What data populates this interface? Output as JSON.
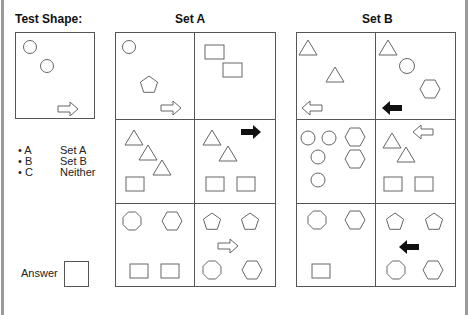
{
  "test_shape": {
    "title": "Test Shape:",
    "contents": [
      "circle",
      "circle",
      "arrow-right-outline"
    ]
  },
  "legend": [
    {
      "key": "• A",
      "label": "Set A"
    },
    {
      "key": "• B",
      "label": "Set B"
    },
    {
      "key": "• C",
      "label": "Neither"
    }
  ],
  "answer": {
    "label": "Answer",
    "value": ""
  },
  "set_a": {
    "title": "Set A",
    "cells": [
      [
        "circle",
        "pentagon",
        "arrow-right-outline"
      ],
      [
        "square",
        "square"
      ],
      [
        "triangle",
        "triangle",
        "triangle",
        "square"
      ],
      [
        "triangle",
        "triangle",
        "arrow-right-solid",
        "square",
        "square"
      ],
      [
        "octagon",
        "hexagon",
        "square",
        "square"
      ],
      [
        "pentagon",
        "pentagon",
        "arrow-right-outline",
        "octagon",
        "hexagon"
      ]
    ]
  },
  "set_b": {
    "title": "Set B",
    "cells": [
      [
        "triangle",
        "triangle",
        "arrow-left-outline"
      ],
      [
        "triangle",
        "circle",
        "hexagon",
        "arrow-left-solid"
      ],
      [
        "circle",
        "circle",
        "circle",
        "circle",
        "hexagon",
        "hexagon"
      ],
      [
        "triangle",
        "triangle",
        "arrow-left-outline",
        "square",
        "square"
      ],
      [
        "octagon",
        "hexagon",
        "square"
      ],
      [
        "pentagon",
        "pentagon",
        "arrow-left-solid",
        "octagon",
        "hexagon"
      ]
    ]
  },
  "colors": {
    "line": "#555555",
    "shape_stroke": "#666666",
    "solid_arrow": "#111111",
    "edge": "#9a9a9a"
  }
}
